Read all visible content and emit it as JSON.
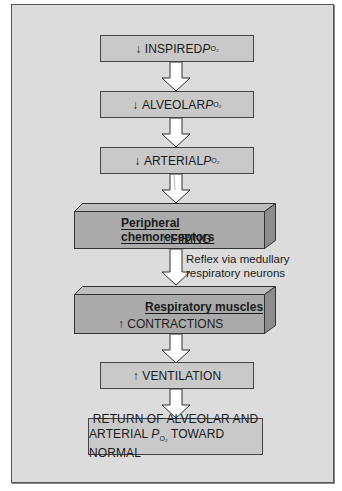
{
  "diagram": {
    "boxes": [
      {
        "id": "inspired",
        "arrow": "↓",
        "text": "INSPIRED ",
        "po": "P",
        "sub": "O₂"
      },
      {
        "id": "alveolar",
        "arrow": "↓",
        "text": "ALVEOLAR ",
        "po": "P",
        "sub": "O₂"
      },
      {
        "id": "arterial",
        "arrow": "↓",
        "text": "ARTERIAL ",
        "po": "P",
        "sub": "O₂"
      },
      {
        "id": "ventilation",
        "arrow": "↑",
        "text": "VENTILATION"
      }
    ],
    "blocks": [
      {
        "id": "chemoreceptors",
        "title": "Peripheral chemoreceptors",
        "arrow": "↑",
        "text": "FIRING"
      },
      {
        "id": "muscles",
        "title": "Respiratory muscles",
        "arrow": "↑",
        "text": "CONTRACTIONS"
      }
    ],
    "reflex_label": {
      "line1": "Reflex via medullary",
      "line2": "respiratory neurons"
    },
    "final": {
      "line1": "RETURN OF ALVEOLAR AND",
      "line2_pre": "ARTERIAL ",
      "po": "P",
      "sub": "O₂",
      "line2_post": " TOWARD NORMAL"
    },
    "colors": {
      "background": "#dcdcdc",
      "box": "#c9c9c9",
      "block_front": "#aaaaaa",
      "block_top": "#bdbdbd",
      "block_side": "#8c8c8c",
      "arrow_fill": "#ffffff"
    }
  }
}
